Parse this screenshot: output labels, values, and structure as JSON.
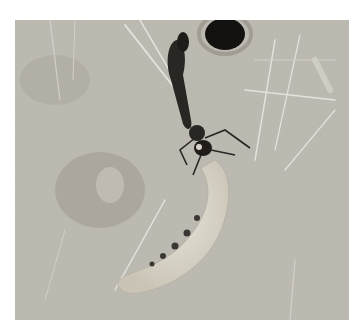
{
  "image": {
    "subject": "wasp dragging a caterpillar larva toward a burrow in sandy soil",
    "elements": [
      "wasp",
      "caterpillar",
      "burrow-hole",
      "grass-blades",
      "sandy-ground"
    ],
    "colors": {
      "ground": "#b9b6ad",
      "ground_dark": "#9e9a90",
      "caterpillar": "#dcd8cc",
      "wasp": "#2a2624",
      "burrow": "#141210",
      "grass": "#e4e2dc"
    }
  }
}
